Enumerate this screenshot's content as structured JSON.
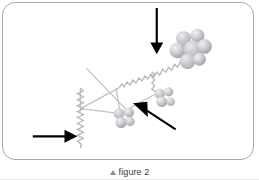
{
  "figure": {
    "caption_marker_icon": "triangle-up-icon",
    "caption_text": "figure 2",
    "panel": {
      "background_color": "#ffffff",
      "border_color": "#a9a9ad",
      "corner_radius_px": 13
    },
    "colors": {
      "structure_light": "#c9c9cc",
      "structure_mid": "#b0b0b4",
      "structure_dark": "#8e8e93",
      "sphere_fill": "#cfcfd2",
      "sphere_shadow": "#a0a0a5",
      "sphere_highlight": "#ededf0",
      "annotation_arrow": "#000000",
      "caption_text": "#3a3a3c",
      "caption_marker": "#8d8d91"
    },
    "diagram": {
      "type": "grayscale-molecular-structure",
      "description": "Grayscale ball-and-stick / polymer schematic: zig-zag (helical) chains connecting three clusters of spheres, crossed by thin straight struts, with three black annotation arrows pointing at features of interest.",
      "sphere_clusters": [
        {
          "name": "upper-right-cluster",
          "sphere_count": 6,
          "center": [
            191,
            47
          ],
          "radius_px": 9
        },
        {
          "name": "middle-right-cluster",
          "sphere_count": 4,
          "center": [
            162,
            97
          ],
          "radius_px": 6
        },
        {
          "name": "lower-middle-cluster",
          "sphere_count": 4,
          "center": [
            122,
            117
          ],
          "radius_px": 6.5
        }
      ],
      "zigzag_chains": [
        {
          "name": "main-diagonal-chain",
          "from": [
            120,
            88
          ],
          "to": [
            174,
            56
          ],
          "amplitude_px": 3,
          "periods": 13
        },
        {
          "name": "branch-chain",
          "from": [
            152,
            72
          ],
          "to": [
            160,
            92
          ],
          "amplitude_px": 2.6,
          "periods": 6
        },
        {
          "name": "vertical-left-chain",
          "from": [
            80,
            88
          ],
          "to": [
            80,
            148
          ],
          "amplitude_px": 2.6,
          "periods": 13
        }
      ],
      "straight_struts": [
        {
          "name": "strut-long-diagonal",
          "from": [
            86,
            69
          ],
          "to": [
            131,
            116
          ]
        },
        {
          "name": "strut-upper-left-to-cluster",
          "from": [
            122,
            114
          ],
          "to": [
            84,
            109
          ]
        },
        {
          "name": "strut-top-left-down",
          "from": [
            80,
            88
          ],
          "to": [
            80,
            112
          ]
        },
        {
          "name": "strut-cluster-to-chain",
          "from": [
            121,
            113
          ],
          "to": [
            117,
            88
          ]
        },
        {
          "name": "strut-cluster-to-right",
          "from": [
            123,
            113
          ],
          "to": [
            156,
            94
          ]
        }
      ]
    },
    "annotations": [
      {
        "id": "arrow-top-down",
        "icon": "arrow-down-icon",
        "direction": "down",
        "tail": [
          158,
          7
        ],
        "head": [
          158,
          52
        ],
        "points_at": "upper-right-cluster"
      },
      {
        "id": "arrow-left-right",
        "icon": "arrow-right-icon",
        "direction": "right",
        "tail": [
          32,
          137
        ],
        "head": [
          77,
          137
        ],
        "points_at": "vertical-left-chain"
      },
      {
        "id": "arrow-diagonal-up-left",
        "icon": "arrow-up-left-icon",
        "direction": "up-left",
        "tail": [
          176,
          130
        ],
        "head": [
          135,
          103
        ],
        "points_at": "lower-middle-cluster"
      }
    ]
  }
}
